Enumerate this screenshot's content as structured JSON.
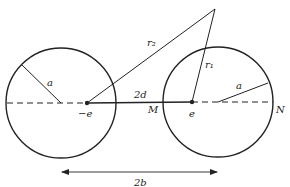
{
  "diagram": {
    "colors": {
      "stroke": "#222222",
      "background": "#ffffff"
    },
    "labels": {
      "left_radius": "a",
      "right_radius": "a",
      "r2": "r₂",
      "r1": "r₁",
      "separation": "2d",
      "neg_charge": "−e",
      "pos_charge": "e",
      "point_M": "M",
      "point_N": "N",
      "center_distance": "2b"
    },
    "geometry": {
      "left_circle": {
        "cx": 61,
        "cy": 103,
        "r": 55
      },
      "right_circle": {
        "cx": 218,
        "cy": 102,
        "r": 55
      },
      "axis_y": 102,
      "neg_charge_point": [
        87,
        103
      ],
      "pos_charge_point": [
        192,
        102
      ],
      "field_point": [
        215,
        9
      ],
      "arrow_y": 172,
      "arrow_x": [
        62,
        217
      ]
    }
  }
}
